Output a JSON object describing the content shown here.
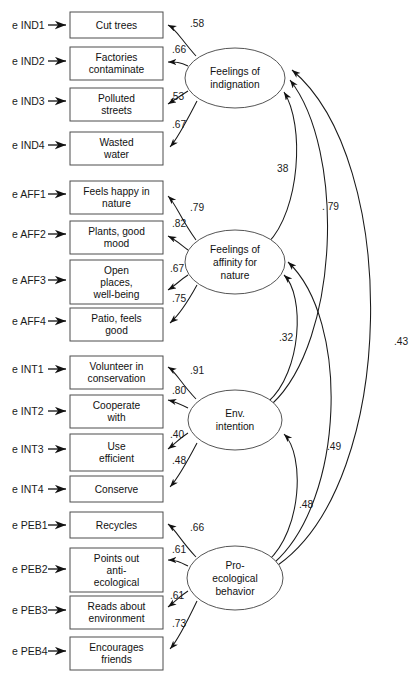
{
  "diagram": {
    "type": "structural-equation-model-path-diagram",
    "width": 418,
    "height": 679,
    "stroke_color": "#1a1a1a",
    "box_stroke_color": "#4d4d4d",
    "background": "#ffffff"
  },
  "error_terms": [
    {
      "label": "e IND1"
    },
    {
      "label": "e IND2"
    },
    {
      "label": "e IND3"
    },
    {
      "label": "e IND4"
    },
    {
      "label": "e AFF1"
    },
    {
      "label": "e AFF2"
    },
    {
      "label": "e AFF3"
    },
    {
      "label": "e AFF4"
    },
    {
      "label": "e INT1"
    },
    {
      "label": "e INT2"
    },
    {
      "label": "e INT3"
    },
    {
      "label": "e INT4"
    },
    {
      "label": "e PEB1"
    },
    {
      "label": "e PEB2"
    },
    {
      "label": "e PEB3"
    },
    {
      "label": "e PEB4"
    }
  ],
  "indicators": [
    {
      "id": "IND1",
      "lines": [
        "Cut trees"
      ]
    },
    {
      "id": "IND2",
      "lines": [
        "Factories",
        "contaminate"
      ]
    },
    {
      "id": "IND3",
      "lines": [
        "Polluted",
        "streets"
      ]
    },
    {
      "id": "IND4",
      "lines": [
        "Wasted",
        "water"
      ]
    },
    {
      "id": "AFF1",
      "lines": [
        "Feels happy in",
        "nature"
      ]
    },
    {
      "id": "AFF2",
      "lines": [
        "Plants, good",
        "mood"
      ]
    },
    {
      "id": "AFF3",
      "lines": [
        "Open",
        "places,",
        "well-being"
      ]
    },
    {
      "id": "AFF4",
      "lines": [
        "Patio, feels",
        "good"
      ]
    },
    {
      "id": "INT1",
      "lines": [
        "Volunteer in",
        "conservation"
      ]
    },
    {
      "id": "INT2",
      "lines": [
        "Cooperate",
        "with"
      ]
    },
    {
      "id": "INT3",
      "lines": [
        "Use",
        "efficient"
      ]
    },
    {
      "id": "INT4",
      "lines": [
        "Conserve"
      ]
    },
    {
      "id": "PEB1",
      "lines": [
        "Recycles"
      ]
    },
    {
      "id": "PEB2",
      "lines": [
        "Points out",
        "anti-",
        "ecological"
      ]
    },
    {
      "id": "PEB3",
      "lines": [
        "Reads about",
        "environment"
      ]
    },
    {
      "id": "PEB4",
      "lines": [
        "Encourages",
        "friends"
      ]
    }
  ],
  "latent_factors": [
    {
      "id": "IND",
      "lines": [
        "Feelings of",
        "indignation"
      ]
    },
    {
      "id": "AFF",
      "lines": [
        "Feelings of",
        "affinity for",
        "nature"
      ]
    },
    {
      "id": "INT",
      "lines": [
        "Env.",
        "intention"
      ]
    },
    {
      "id": "PEB",
      "lines": [
        "Pro-",
        "ecological",
        "behavior"
      ]
    }
  ],
  "loadings": [
    {
      "from": "IND",
      "to": "IND1",
      "value": ".58"
    },
    {
      "from": "IND",
      "to": "IND2",
      "value": ".66"
    },
    {
      "from": "IND",
      "to": "IND3",
      "value": ".53"
    },
    {
      "from": "IND",
      "to": "IND4",
      "value": ".67"
    },
    {
      "from": "AFF",
      "to": "AFF1",
      "value": ".79"
    },
    {
      "from": "AFF",
      "to": "AFF2",
      "value": ".82"
    },
    {
      "from": "AFF",
      "to": "AFF3",
      "value": ".67"
    },
    {
      "from": "AFF",
      "to": "AFF4",
      "value": ".75"
    },
    {
      "from": "INT",
      "to": "INT1",
      "value": ".91"
    },
    {
      "from": "INT",
      "to": "INT2",
      "value": ".80"
    },
    {
      "from": "INT",
      "to": "INT3",
      "value": ".40"
    },
    {
      "from": "INT",
      "to": "INT4",
      "value": ".48"
    },
    {
      "from": "PEB",
      "to": "PEB1",
      "value": ".66"
    },
    {
      "from": "PEB",
      "to": "PEB2",
      "value": ".61"
    },
    {
      "from": "PEB",
      "to": "PEB3",
      "value": ".61"
    },
    {
      "from": "PEB",
      "to": "PEB4",
      "value": ".73"
    }
  ],
  "structural_paths": [
    {
      "from": "AFF",
      "to": "IND",
      "value": "38"
    },
    {
      "from": "INT",
      "to": "IND",
      "value": ". 79"
    },
    {
      "from": "PEB",
      "to": "IND",
      "value": ".43"
    },
    {
      "from": "INT",
      "to": "AFF",
      "value": ".32"
    },
    {
      "from": "PEB",
      "to": "AFF",
      "value": ".49"
    },
    {
      "from": "PEB",
      "to": "INT",
      "value": ".48"
    }
  ]
}
